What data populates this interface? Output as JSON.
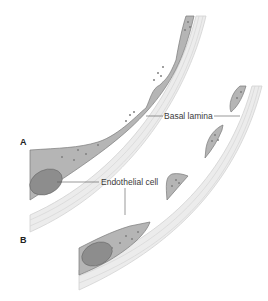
{
  "figure": {
    "panels": [
      {
        "id": "A",
        "label": "A"
      },
      {
        "id": "B",
        "label": "B"
      }
    ],
    "labels": {
      "basal_lamina": "Basal lamina",
      "endothelial_cell": "Endothelial cell"
    },
    "colors": {
      "cell_fill": "#b5b5b5",
      "cell_outline": "#7a7a7a",
      "nucleus_fill": "#8d8d8d",
      "lamina_band": "#e4e4e4",
      "lamina_line": "#cfcfcf",
      "leader_line": "#555555",
      "granule": "#808080"
    }
  }
}
